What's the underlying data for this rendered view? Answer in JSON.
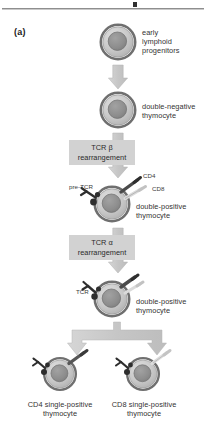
{
  "figure": {
    "panel_label": "(a)",
    "title_rule": "horizontal-rule",
    "colors": {
      "cell_outer_ring": "#7d7d7d",
      "cell_cytoplasm": "#c7c7c7",
      "cell_nucleus": "#8f8f8f",
      "arrow_fill": "#c9c9c9",
      "process_box_fill": "#d2d2d2",
      "receptor_dark": "#2e2e2e",
      "receptor_light": "#d8d8d8",
      "text": "#333333"
    },
    "stages": [
      {
        "id": "early-lymphoid-progenitors",
        "label": "early\nlymphoid\nprogenitors",
        "label_line1": "early",
        "label_line2": "lymphoid",
        "label_line3": "progenitors"
      },
      {
        "id": "double-negative-thymocyte",
        "label_line1": "double-negative",
        "label_line2": "thymocyte"
      },
      {
        "id": "double-positive-thymocyte-1",
        "label_line1": "double-positive",
        "label_line2": "thymocyte"
      },
      {
        "id": "double-positive-thymocyte-2",
        "label_line1": "double-positive",
        "label_line2": "thymocyte"
      },
      {
        "id": "cd4-single-positive-thymocyte",
        "label_line1": "CD4 single-positive",
        "label_line2": "thymocyte"
      },
      {
        "id": "cd8-single-positive-thymocyte",
        "label_line1": "CD8 single-positive",
        "label_line2": "thymocyte"
      }
    ],
    "processes": [
      {
        "id": "tcr-beta-rearrangement",
        "line1": "TCR β",
        "line2": "rearrangement"
      },
      {
        "id": "tcr-alpha-rearrangement",
        "line1": "TCR α",
        "line2": "rearrangement"
      }
    ],
    "markers": {
      "pre_tcr": "pre-TCR",
      "cd4": "CD4",
      "cd8": "CD8",
      "tcr": "TCR"
    },
    "icons": {
      "cell": "cell-icon",
      "arrow_down": "arrow-down-icon",
      "branch_arrow": "branch-arrow-icon",
      "pre_tcr_receptor": "pre-tcr-receptor-icon",
      "tcr_receptor": "tcr-receptor-icon",
      "cd4_coreceptor": "cd4-coreceptor-icon",
      "cd8_coreceptor": "cd8-coreceptor-icon"
    }
  }
}
